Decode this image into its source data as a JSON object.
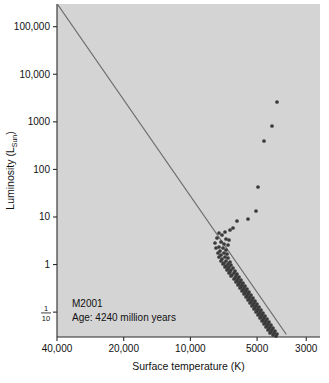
{
  "chart_data": {
    "type": "scatter",
    "title": "",
    "xlabel": "Surface temperature (K)",
    "ylabel": "Luminosity (L_Sun)",
    "ylabel_main": "Luminosity (L",
    "ylabel_sub": "Sun",
    "ylabel_tail": ")",
    "x_axis": {
      "scale": "log",
      "reversed": true,
      "min": 40000,
      "max": 2600,
      "ticks": [
        40000,
        20000,
        10000,
        5000,
        3000
      ],
      "tick_labels": [
        "40,000",
        "20,000",
        "10,000",
        "5000",
        "3000"
      ]
    },
    "y_axis": {
      "scale": "log",
      "min": 0.03,
      "max": 300000,
      "ticks": [
        100000,
        10000,
        1000,
        100,
        10,
        1,
        0.1
      ],
      "tick_labels": [
        "100,000",
        "10,000",
        "1000",
        "100",
        "10",
        "1",
        "1/10"
      ],
      "fraction_tick": {
        "numerator": "1",
        "denominator": "10"
      }
    },
    "grid": false,
    "legend_position": "none",
    "annotations": [
      {
        "name": "cluster-name",
        "text": "M2001",
        "x_px": 72,
        "y_px": 307
      },
      {
        "name": "cluster-age",
        "text": "Age: 4240 million years",
        "x_px": 72,
        "y_px": 321
      }
    ],
    "reference_line": {
      "name": "zero-age-main-sequence",
      "color": "#6f6f6f",
      "width": 1.3,
      "points_px": [
        [
          58,
          5
        ],
        [
          286,
          334
        ]
      ]
    },
    "series": [
      {
        "name": "cluster stars",
        "marker": "filled-circle",
        "color": "#3a3a3a",
        "size_px": 2.5,
        "points_px": [
          [
            277,
            102
          ],
          [
            272,
            126
          ],
          [
            264,
            141
          ],
          [
            258,
            187
          ],
          [
            256,
            211
          ],
          [
            248,
            219
          ],
          [
            237,
            221
          ],
          [
            233,
            228
          ],
          [
            230,
            230
          ],
          [
            225,
            232
          ],
          [
            222,
            235
          ],
          [
            219,
            233
          ],
          [
            226,
            239
          ],
          [
            229,
            240
          ],
          [
            217,
            238
          ],
          [
            221,
            242
          ],
          [
            224,
            244
          ],
          [
            228,
            245
          ],
          [
            215,
            243
          ],
          [
            219,
            247
          ],
          [
            223,
            248
          ],
          [
            226,
            250
          ],
          [
            216,
            248
          ],
          [
            220,
            251
          ],
          [
            224,
            253
          ],
          [
            227,
            254
          ],
          [
            218,
            253
          ],
          [
            221,
            255
          ],
          [
            225,
            257
          ],
          [
            228,
            258
          ],
          [
            219,
            257
          ],
          [
            222,
            259
          ],
          [
            226,
            261
          ],
          [
            230,
            262
          ],
          [
            221,
            261
          ],
          [
            224,
            263
          ],
          [
            228,
            264
          ],
          [
            231,
            265
          ],
          [
            223,
            264
          ],
          [
            226,
            266
          ],
          [
            229,
            267
          ],
          [
            233,
            268
          ],
          [
            225,
            267
          ],
          [
            228,
            269
          ],
          [
            231,
            270
          ],
          [
            235,
            271
          ],
          [
            227,
            270
          ],
          [
            230,
            272
          ],
          [
            234,
            273
          ],
          [
            237,
            274
          ],
          [
            229,
            273
          ],
          [
            232,
            275
          ],
          [
            236,
            276
          ],
          [
            239,
            277
          ],
          [
            231,
            276
          ],
          [
            235,
            278
          ],
          [
            238,
            279
          ],
          [
            241,
            280
          ],
          [
            234,
            279
          ],
          [
            237,
            281
          ],
          [
            240,
            282
          ],
          [
            243,
            283
          ],
          [
            236,
            282
          ],
          [
            239,
            284
          ],
          [
            242,
            285
          ],
          [
            245,
            286
          ],
          [
            238,
            285
          ],
          [
            241,
            287
          ],
          [
            244,
            288
          ],
          [
            247,
            289
          ],
          [
            240,
            288
          ],
          [
            243,
            290
          ],
          [
            246,
            291
          ],
          [
            249,
            292
          ],
          [
            242,
            291
          ],
          [
            245,
            293
          ],
          [
            248,
            294
          ],
          [
            251,
            295
          ],
          [
            244,
            294
          ],
          [
            247,
            296
          ],
          [
            250,
            297
          ],
          [
            253,
            298
          ],
          [
            246,
            297
          ],
          [
            249,
            299
          ],
          [
            252,
            300
          ],
          [
            255,
            301
          ],
          [
            248,
            300
          ],
          [
            251,
            302
          ],
          [
            254,
            303
          ],
          [
            257,
            304
          ],
          [
            250,
            303
          ],
          [
            253,
            305
          ],
          [
            256,
            306
          ],
          [
            259,
            307
          ],
          [
            252,
            306
          ],
          [
            255,
            308
          ],
          [
            258,
            309
          ],
          [
            261,
            310
          ],
          [
            254,
            309
          ],
          [
            257,
            311
          ],
          [
            260,
            312
          ],
          [
            263,
            313
          ],
          [
            256,
            312
          ],
          [
            259,
            314
          ],
          [
            262,
            315
          ],
          [
            265,
            316
          ],
          [
            258,
            315
          ],
          [
            261,
            317
          ],
          [
            264,
            318
          ],
          [
            267,
            319
          ],
          [
            260,
            318
          ],
          [
            263,
            320
          ],
          [
            266,
            321
          ],
          [
            269,
            322
          ],
          [
            262,
            321
          ],
          [
            265,
            323
          ],
          [
            268,
            324
          ],
          [
            271,
            325
          ],
          [
            264,
            324
          ],
          [
            267,
            326
          ],
          [
            270,
            327
          ],
          [
            273,
            328
          ],
          [
            266,
            327
          ],
          [
            269,
            329
          ],
          [
            272,
            330
          ],
          [
            275,
            331
          ],
          [
            268,
            330
          ],
          [
            271,
            332
          ],
          [
            274,
            333
          ],
          [
            277,
            334
          ],
          [
            270,
            333
          ],
          [
            273,
            335
          ],
          [
            276,
            336
          ]
        ]
      }
    ]
  },
  "plot_geometry": {
    "left_px": 57,
    "right_px": 320,
    "top_px": 4,
    "bottom_px": 337,
    "background": "#d4d4d4",
    "axis_color": "#2b2b2b"
  }
}
